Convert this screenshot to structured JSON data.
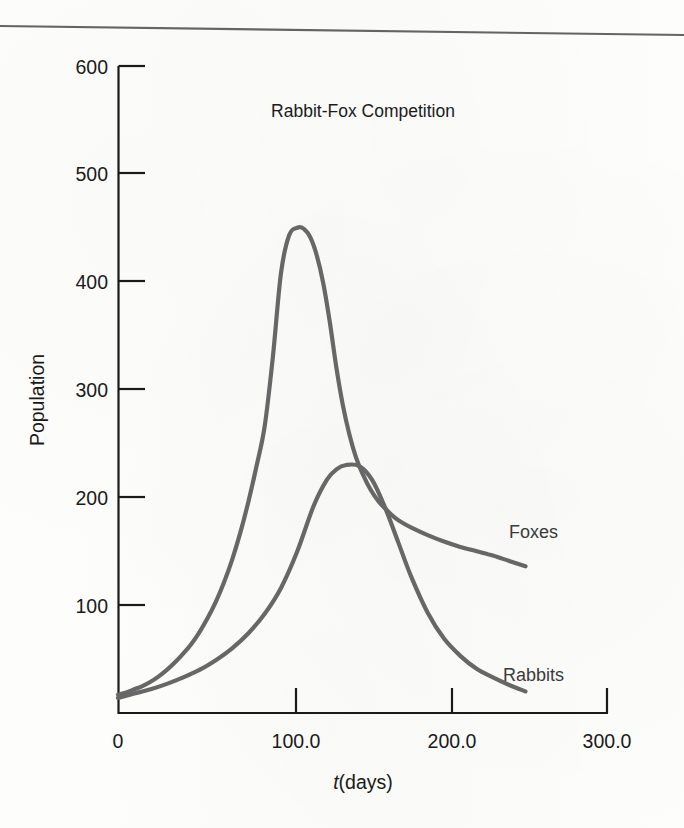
{
  "figure": {
    "background_color": "#fdfdfc",
    "rule_color": "#4a4a4a",
    "axis_color": "#1a1a1a",
    "curve_color": "#676767"
  },
  "chart_data": {
    "type": "line",
    "title": "Rabbit-Fox Competition",
    "xlabel": "t(days)",
    "xlabel_variable": "t",
    "xlabel_unit": "(days)",
    "ylabel": "Population",
    "xlim": [
      0,
      300
    ],
    "ylim": [
      0,
      600
    ],
    "grid": false,
    "legend_position": "inline-curve-labels",
    "xticks": [
      "0",
      "100.0",
      "200.0",
      "300.0"
    ],
    "xtick_values": [
      0,
      100,
      200,
      300
    ],
    "yticks": [
      "100",
      "200",
      "300",
      "400",
      "500",
      "600"
    ],
    "ytick_values": [
      100,
      200,
      300,
      400,
      500,
      600
    ],
    "annotations": [
      {
        "text": "Foxes",
        "x": 265,
        "y": 170
      },
      {
        "text": "Rabbits",
        "x": 260,
        "y": 50
      }
    ],
    "series": [
      {
        "name": "Foxes",
        "label": "Foxes",
        "color": "#676767",
        "x": [
          0,
          5,
          10,
          15,
          20,
          25,
          30,
          35,
          40,
          45,
          50,
          55,
          60,
          65,
          70,
          75,
          80,
          85,
          90,
          95,
          100,
          105,
          110,
          114,
          118,
          122,
          126,
          130,
          134,
          138,
          142,
          146,
          150,
          155,
          160,
          165,
          170,
          175,
          180,
          190,
          200,
          210,
          220,
          230,
          240,
          250
        ],
        "y": [
          17,
          19,
          22,
          25,
          29,
          34,
          40,
          47,
          55,
          64,
          75,
          88,
          103,
          121,
          142,
          167,
          196,
          229,
          266,
          330,
          408,
          443,
          450,
          449,
          441,
          424,
          398,
          362,
          320,
          285,
          258,
          237,
          222,
          207,
          196,
          188,
          181,
          176,
          172,
          165,
          159,
          154,
          150,
          146,
          141,
          136
        ]
      },
      {
        "name": "Rabbits",
        "label": "Rabbits",
        "color": "#676767",
        "x": [
          0,
          10,
          20,
          30,
          40,
          50,
          60,
          70,
          80,
          90,
          100,
          110,
          120,
          128,
          134,
          140,
          148,
          156,
          164,
          172,
          180,
          190,
          200,
          210,
          220,
          230,
          240,
          250
        ],
        "y": [
          14,
          18,
          22,
          27,
          33,
          40,
          49,
          60,
          74,
          92,
          116,
          150,
          192,
          216,
          226,
          230,
          229,
          216,
          190,
          158,
          126,
          93,
          69,
          53,
          41,
          33,
          26,
          20
        ]
      }
    ]
  }
}
